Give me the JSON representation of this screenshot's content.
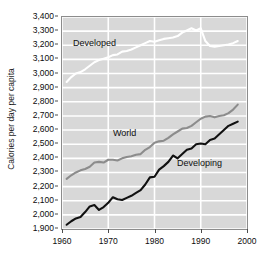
{
  "chart_data": {
    "type": "line",
    "title": "",
    "subtitle": "",
    "xlabel": "",
    "ylabel": "Calories per day per capita",
    "xlim": [
      1960,
      2000
    ],
    "ylim": [
      1900,
      3400
    ],
    "grid": true,
    "legend_position": "inline-annotations",
    "xticks": [
      "1960",
      "1970",
      "1980",
      "1990",
      "2000"
    ],
    "yticks": [
      "1,900",
      "2,000",
      "2,100",
      "2,200",
      "2,300",
      "2,400",
      "2,500",
      "2,600",
      "2,700",
      "2,800",
      "2,900",
      "3,000",
      "3,100",
      "3,200",
      "3,300",
      "3,400"
    ],
    "x": [
      1961,
      1962,
      1963,
      1964,
      1965,
      1966,
      1967,
      1968,
      1969,
      1970,
      1971,
      1972,
      1973,
      1974,
      1975,
      1976,
      1977,
      1978,
      1979,
      1980,
      1981,
      1982,
      1983,
      1984,
      1985,
      1986,
      1987,
      1988,
      1989,
      1990,
      1991,
      1992,
      1993,
      1994,
      1995,
      1996,
      1997,
      1998
    ],
    "series": [
      {
        "name": "Developed",
        "color": "#ffffff",
        "label": "Developed",
        "values": [
          2940,
          2975,
          3000,
          3010,
          3030,
          3055,
          3080,
          3095,
          3105,
          3115,
          3130,
          3135,
          3155,
          3160,
          3170,
          3185,
          3200,
          3215,
          3230,
          3225,
          3235,
          3245,
          3250,
          3255,
          3265,
          3290,
          3305,
          3320,
          3305,
          3320,
          3230,
          3195,
          3190,
          3195,
          3200,
          3205,
          3215,
          3230
        ]
      },
      {
        "name": "World",
        "color": "#8c8c8c",
        "label": "World",
        "values": [
          2255,
          2280,
          2300,
          2315,
          2325,
          2340,
          2370,
          2375,
          2370,
          2390,
          2390,
          2385,
          2400,
          2410,
          2415,
          2425,
          2430,
          2460,
          2480,
          2510,
          2520,
          2525,
          2545,
          2570,
          2590,
          2610,
          2615,
          2630,
          2655,
          2680,
          2695,
          2700,
          2690,
          2700,
          2705,
          2720,
          2745,
          2780
        ]
      },
      {
        "name": "Developing",
        "color": "#111111",
        "label": "Developing",
        "values": [
          1930,
          1955,
          1975,
          1985,
          2020,
          2060,
          2070,
          2035,
          2055,
          2085,
          2125,
          2110,
          2105,
          2120,
          2135,
          2155,
          2175,
          2215,
          2265,
          2270,
          2320,
          2345,
          2375,
          2420,
          2400,
          2430,
          2460,
          2470,
          2500,
          2505,
          2500,
          2530,
          2540,
          2570,
          2600,
          2630,
          2645,
          2660
        ]
      }
    ],
    "colors": {
      "plot_background": "#d8d8d8",
      "gridline": "#ffffff",
      "plot_border": "#8c8c8c",
      "tick_label": "#0d0d0d"
    }
  }
}
